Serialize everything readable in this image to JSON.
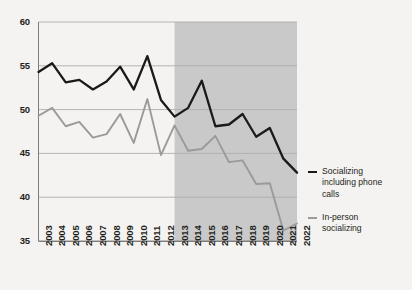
{
  "chart_data": {
    "type": "line",
    "title": "",
    "subtitle": "",
    "xlabel": "",
    "ylabel": "",
    "x": [
      2003,
      2004,
      2005,
      2006,
      2007,
      2008,
      2009,
      2010,
      2011,
      2012,
      2013,
      2014,
      2015,
      2016,
      2017,
      2018,
      2019,
      2020,
      2021,
      2022
    ],
    "categories": [
      "2003",
      "2004",
      "2005",
      "2006",
      "2007",
      "2008",
      "2009",
      "2010",
      "2011",
      "2012",
      "2013",
      "2014",
      "2015",
      "2016",
      "2017",
      "2018",
      "2019",
      "2020",
      "2021",
      "2022"
    ],
    "series": [
      {
        "name": "Socializing including phone calls",
        "color": "#1a1a1a",
        "values": [
          54.3,
          55.3,
          53.1,
          53.4,
          52.3,
          53.2,
          54.9,
          52.3,
          56.1,
          51.1,
          49.2,
          50.2,
          53.3,
          48.1,
          48.3,
          49.5,
          46.9,
          47.9,
          44.4,
          42.8
        ]
      },
      {
        "name": "In-person socializing",
        "color": "#9a9a9a",
        "values": [
          49.3,
          50.2,
          48.1,
          48.6,
          46.8,
          47.2,
          49.5,
          46.2,
          51.2,
          44.8,
          48.2,
          45.3,
          45.5,
          47.0,
          44.0,
          44.2,
          41.5,
          41.6,
          36.2,
          37.0
        ]
      }
    ],
    "ylim": [
      35,
      60
    ],
    "yticks": [
      35,
      40,
      45,
      50,
      55,
      60
    ],
    "ytick_labels": [
      "35",
      "40",
      "45",
      "50",
      "55",
      "60"
    ],
    "xlim": [
      2003,
      2022
    ],
    "grid": true,
    "grid_axis": "y",
    "legend_position": "right",
    "annotations": [
      {
        "type": "shaded-band",
        "label": "",
        "x_start": 2013,
        "x_end": 2022,
        "color": "#c9c9c9"
      }
    ]
  },
  "legend": {
    "entries": [
      {
        "label_line1": "Socializing",
        "label_line2": "including phone",
        "label_line3": "calls"
      },
      {
        "label_line1": "In-person",
        "label_line2": "socializing",
        "label_line3": ""
      }
    ]
  }
}
